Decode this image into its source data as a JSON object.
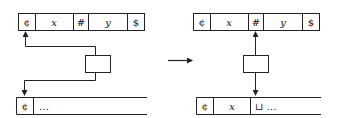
{
  "diagram": {
    "type": "turing-machine-transition",
    "stroke_color": "#222222",
    "background": "#ffffff",
    "before": {
      "input_tape": {
        "cells": [
          "¢",
          "x",
          "#",
          "y",
          "$"
        ],
        "head_position_index": 0
      },
      "work_tape": {
        "cells": [
          "¢",
          "…"
        ],
        "head_position_index": 0
      },
      "control_box": {
        "label": ""
      }
    },
    "transition_arrow": {
      "label": ""
    },
    "after": {
      "input_tape": {
        "cells": [
          "¢",
          "x",
          "#",
          "y",
          "$"
        ],
        "head_position_index": 2
      },
      "work_tape": {
        "cells": [
          "¢",
          "x",
          "⊔ …"
        ],
        "head_position_index": 2
      },
      "control_box": {
        "label": ""
      }
    }
  }
}
